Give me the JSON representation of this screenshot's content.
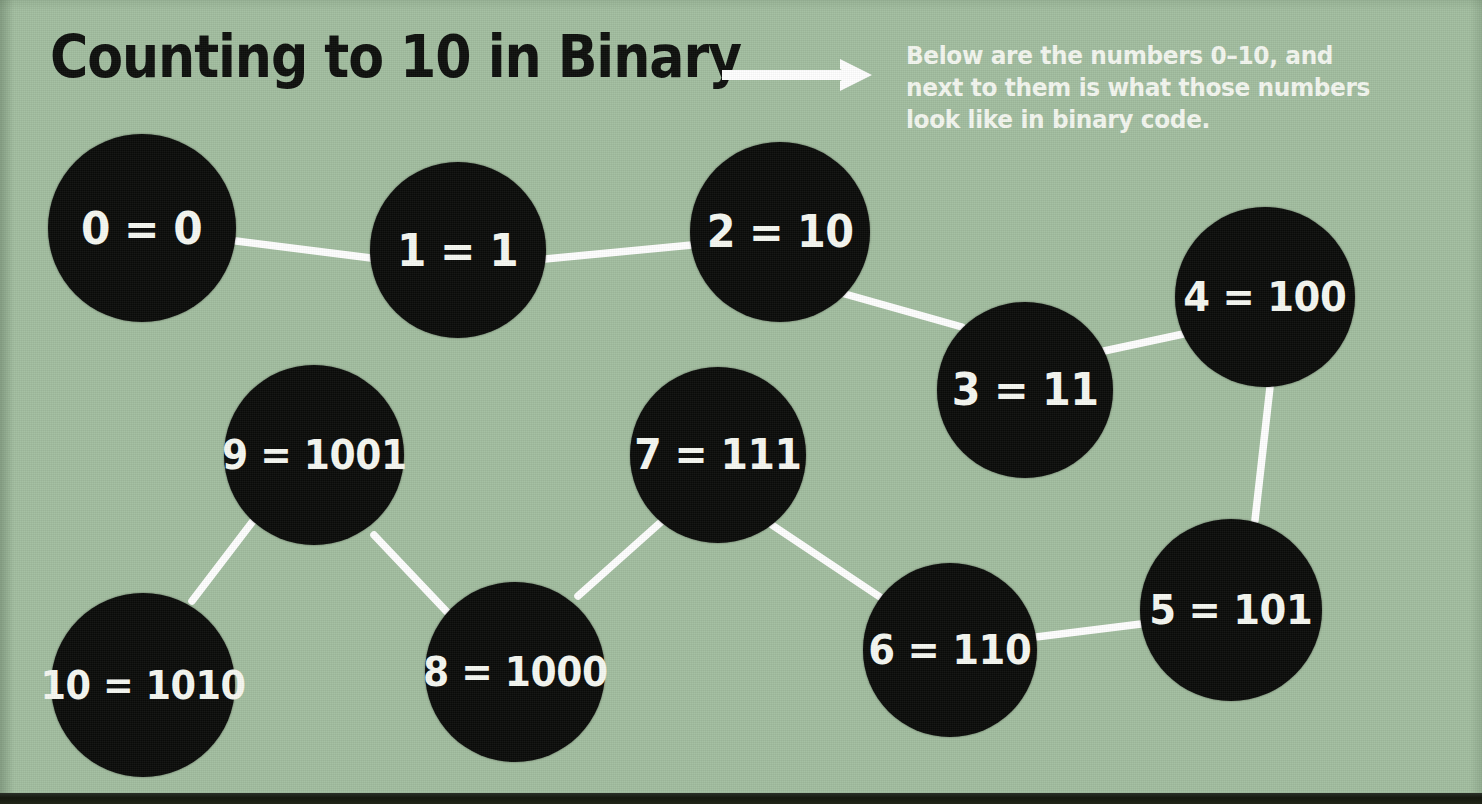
{
  "header": {
    "title": "Counting to 10 in Binary",
    "arrow_icon": "arrow-right-icon",
    "caption": "Below are the numbers 0–10, and next to them is what those numbers look like in binary code."
  },
  "colors": {
    "background": "#a2bd9f",
    "node_fill": "#0a0b09",
    "node_text": "#f6f8f2",
    "edge_line": "#ffffff",
    "title_text": "#0d0f0c"
  },
  "chart_data": {
    "type": "diagram-graph",
    "title": "Counting to 10 in Binary",
    "subtitle": "Below are the numbers 0–10, and next to them is what those numbers look like in binary code.",
    "legend": [],
    "grid": false,
    "nodes": [
      {
        "id": "0",
        "decimal": 0,
        "binary": "0",
        "label": "0 = 0",
        "cx": 142,
        "cy": 228,
        "r": 94,
        "font": 45
      },
      {
        "id": "1",
        "decimal": 1,
        "binary": "1",
        "label": "1 = 1",
        "cx": 458,
        "cy": 250,
        "r": 88,
        "font": 45
      },
      {
        "id": "2",
        "decimal": 2,
        "binary": "10",
        "label": "2 = 10",
        "cx": 780,
        "cy": 232,
        "r": 90,
        "font": 44
      },
      {
        "id": "3",
        "decimal": 3,
        "binary": "11",
        "label": "3 = 11",
        "cx": 1025,
        "cy": 390,
        "r": 88,
        "font": 44
      },
      {
        "id": "4",
        "decimal": 4,
        "binary": "100",
        "label": "4 = 100",
        "cx": 1265,
        "cy": 297,
        "r": 90,
        "font": 41
      },
      {
        "id": "5",
        "decimal": 5,
        "binary": "101",
        "label": "5 = 101",
        "cx": 1231,
        "cy": 610,
        "r": 91,
        "font": 41
      },
      {
        "id": "6",
        "decimal": 6,
        "binary": "110",
        "label": "6 = 110",
        "cx": 950,
        "cy": 650,
        "r": 87,
        "font": 41
      },
      {
        "id": "7",
        "decimal": 7,
        "binary": "111",
        "label": "7 = 111",
        "cx": 718,
        "cy": 455,
        "r": 88,
        "font": 42
      },
      {
        "id": "8",
        "decimal": 8,
        "binary": "1000",
        "label": "8 = 1000",
        "cx": 515,
        "cy": 672,
        "r": 90,
        "font": 40
      },
      {
        "id": "9",
        "decimal": 9,
        "binary": "1001",
        "label": "9 = 1001",
        "cx": 314,
        "cy": 455,
        "r": 90,
        "font": 40
      },
      {
        "id": "10",
        "decimal": 10,
        "binary": "1010",
        "label": "10 = 1010",
        "cx": 143,
        "cy": 685,
        "r": 92,
        "font": 39
      }
    ],
    "edges": [
      {
        "from": "0",
        "to": "1",
        "x1": 236,
        "y1": 241,
        "x2": 371,
        "y2": 258
      },
      {
        "from": "1",
        "to": "2",
        "x1": 545,
        "y1": 259,
        "x2": 692,
        "y2": 245
      },
      {
        "from": "2",
        "to": "3",
        "x1": 845,
        "y1": 294,
        "x2": 962,
        "y2": 327
      },
      {
        "from": "3",
        "to": "4",
        "x1": 1104,
        "y1": 351,
        "x2": 1188,
        "y2": 333
      },
      {
        "from": "4",
        "to": "5",
        "x1": 1270,
        "y1": 387,
        "x2": 1255,
        "y2": 520
      },
      {
        "from": "5",
        "to": "6",
        "x1": 1141,
        "y1": 624,
        "x2": 1036,
        "y2": 637
      },
      {
        "from": "6",
        "to": "7",
        "x1": 880,
        "y1": 597,
        "x2": 772,
        "y2": 525
      },
      {
        "from": "7",
        "to": "8",
        "x1": 661,
        "y1": 522,
        "x2": 578,
        "y2": 596
      },
      {
        "from": "8",
        "to": "9",
        "x1": 448,
        "y1": 613,
        "x2": 374,
        "y2": 535
      },
      {
        "from": "9",
        "to": "10",
        "x1": 253,
        "y1": 521,
        "x2": 192,
        "y2": 601
      }
    ]
  }
}
